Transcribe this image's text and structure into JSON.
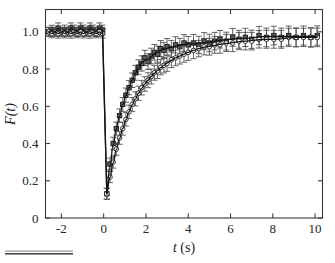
{
  "figure": {
    "name": "frap-recovery-plot",
    "background": "#ffffff",
    "ink": "#262626"
  },
  "artifacts": {
    "scan_rule_label": "scan-edge-rule"
  },
  "chart_data": {
    "type": "scatter",
    "title": "",
    "xlabel": "t (s)",
    "xlabel_symbol": "t",
    "xlabel_unit": "(s)",
    "ylabel": "F(t)",
    "xlim": [
      -2.75,
      10.35
    ],
    "ylim": [
      0,
      1.12
    ],
    "xticks": [
      -2,
      0,
      2,
      4,
      6,
      8,
      10
    ],
    "xticklabels": [
      "-2",
      "0",
      "2",
      "4",
      "6",
      "8",
      "10"
    ],
    "yticks": [
      0,
      0.2,
      0.4,
      0.6,
      0.8,
      1.0
    ],
    "yticklabels": [
      "0",
      "0.2",
      "0.4",
      "0.6",
      "0.8",
      "1.0"
    ],
    "grid": false,
    "legend": "none",
    "error_bars": "vertical, symmetric",
    "series": [
      {
        "name": "fast-recovery",
        "marker": "square",
        "marker_fill": "#5d5d5d",
        "has_fit_line": true,
        "x": [
          -2.6,
          -2.45,
          -2.3,
          -2.15,
          -2.0,
          -1.85,
          -1.7,
          -1.55,
          -1.4,
          -1.25,
          -1.1,
          -0.95,
          -0.8,
          -0.65,
          -0.5,
          -0.35,
          -0.2,
          -0.05,
          0.15,
          0.3,
          0.45,
          0.6,
          0.75,
          0.9,
          1.05,
          1.2,
          1.35,
          1.5,
          1.65,
          1.8,
          1.95,
          2.1,
          2.25,
          2.4,
          2.55,
          2.7,
          2.85,
          3.0,
          3.2,
          3.4,
          3.6,
          3.8,
          4.0,
          4.25,
          4.5,
          4.75,
          5.0,
          5.25,
          5.5,
          5.8,
          6.1,
          6.4,
          6.7,
          7.0,
          7.35,
          7.7,
          8.05,
          8.4,
          8.75,
          9.1,
          9.45,
          9.8,
          10.1
        ],
        "y": [
          1.0,
          1.01,
          1.0,
          1.02,
          1.0,
          1.01,
          1.0,
          1.02,
          1.01,
          1.0,
          1.02,
          1.01,
          1.0,
          1.02,
          1.01,
          1.0,
          1.02,
          1.01,
          0.13,
          0.29,
          0.4,
          0.48,
          0.55,
          0.61,
          0.66,
          0.7,
          0.74,
          0.78,
          0.81,
          0.83,
          0.86,
          0.84,
          0.87,
          0.89,
          0.88,
          0.91,
          0.9,
          0.92,
          0.91,
          0.93,
          0.92,
          0.94,
          0.93,
          0.94,
          0.93,
          0.95,
          0.94,
          0.95,
          0.96,
          0.95,
          0.97,
          0.96,
          0.97,
          0.96,
          0.98,
          0.97,
          0.98,
          0.97,
          0.98,
          0.97,
          0.98,
          0.97,
          0.98
        ],
        "yerr": [
          0.025,
          0.025,
          0.025,
          0.028,
          0.025,
          0.026,
          0.025,
          0.028,
          0.026,
          0.025,
          0.028,
          0.026,
          0.025,
          0.028,
          0.026,
          0.025,
          0.028,
          0.026,
          0.03,
          0.032,
          0.034,
          0.035,
          0.036,
          0.037,
          0.038,
          0.038,
          0.039,
          0.04,
          0.04,
          0.041,
          0.041,
          0.042,
          0.042,
          0.042,
          0.043,
          0.043,
          0.043,
          0.044,
          0.044,
          0.044,
          0.045,
          0.045,
          0.045,
          0.046,
          0.046,
          0.046,
          0.047,
          0.047,
          0.047,
          0.048,
          0.048,
          0.048,
          0.049,
          0.049,
          0.049,
          0.05,
          0.05,
          0.05,
          0.051,
          0.051,
          0.051,
          0.052,
          0.052
        ]
      },
      {
        "name": "slow-recovery",
        "marker": "circle",
        "marker_fill": "#ffffff",
        "has_fit_line": true,
        "x": [
          -2.6,
          -2.45,
          -2.3,
          -2.15,
          -2.0,
          -1.85,
          -1.7,
          -1.55,
          -1.4,
          -1.25,
          -1.1,
          -0.95,
          -0.8,
          -0.65,
          -0.5,
          -0.35,
          -0.2,
          -0.05,
          0.15,
          0.3,
          0.45,
          0.6,
          0.75,
          0.9,
          1.05,
          1.2,
          1.35,
          1.5,
          1.65,
          1.8,
          1.95,
          2.1,
          2.25,
          2.4,
          2.55,
          2.7,
          2.85,
          3.0,
          3.2,
          3.4,
          3.6,
          3.8,
          4.0,
          4.25,
          4.5,
          4.75,
          5.0,
          5.25,
          5.5,
          5.8,
          6.1,
          6.4,
          6.7,
          7.0,
          7.35,
          7.7,
          8.05,
          8.4,
          8.75,
          9.1,
          9.45,
          9.8,
          10.1
        ],
        "y": [
          1.0,
          0.99,
          1.0,
          0.99,
          1.0,
          0.99,
          1.0,
          0.99,
          1.0,
          0.99,
          1.0,
          0.99,
          1.0,
          0.99,
          1.0,
          0.99,
          1.0,
          0.99,
          0.13,
          0.22,
          0.3,
          0.37,
          0.43,
          0.48,
          0.53,
          0.57,
          0.61,
          0.64,
          0.67,
          0.7,
          0.72,
          0.74,
          0.76,
          0.78,
          0.79,
          0.81,
          0.82,
          0.83,
          0.85,
          0.86,
          0.87,
          0.88,
          0.89,
          0.9,
          0.91,
          0.92,
          0.92,
          0.93,
          0.93,
          0.94,
          0.94,
          0.95,
          0.95,
          0.95,
          0.96,
          0.96,
          0.96,
          0.96,
          0.97,
          0.97,
          0.97,
          0.97,
          0.97
        ],
        "yerr": [
          0.022,
          0.022,
          0.022,
          0.024,
          0.022,
          0.023,
          0.022,
          0.024,
          0.023,
          0.022,
          0.024,
          0.023,
          0.022,
          0.024,
          0.023,
          0.022,
          0.024,
          0.023,
          0.028,
          0.03,
          0.032,
          0.033,
          0.034,
          0.035,
          0.036,
          0.036,
          0.037,
          0.038,
          0.038,
          0.039,
          0.039,
          0.04,
          0.04,
          0.04,
          0.041,
          0.041,
          0.041,
          0.042,
          0.042,
          0.042,
          0.043,
          0.043,
          0.043,
          0.044,
          0.044,
          0.044,
          0.045,
          0.045,
          0.045,
          0.046,
          0.046,
          0.046,
          0.047,
          0.047,
          0.047,
          0.048,
          0.048,
          0.048,
          0.049,
          0.049,
          0.049,
          0.05,
          0.05
        ]
      }
    ]
  }
}
